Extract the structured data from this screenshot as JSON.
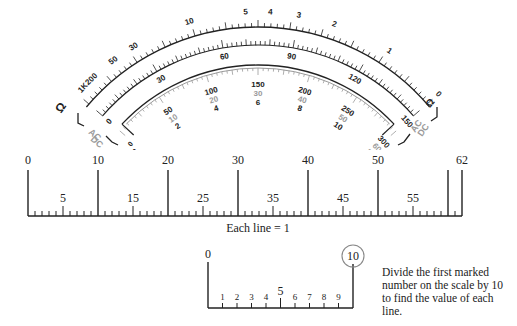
{
  "meter": {
    "ohms_scale": {
      "symbol": "Ω",
      "labels": [
        "1K",
        "200",
        "50",
        "30",
        "10",
        "5",
        "4",
        "3",
        "2",
        "1",
        "0"
      ]
    },
    "dc_voltage_scale": {
      "labels": [
        "0",
        "30",
        "60",
        "90",
        "120",
        "150"
      ]
    },
    "ac_scale": {
      "row1": [
        "0",
        "50",
        "100",
        "150",
        "200",
        "250",
        "300"
      ],
      "row2": [
        "0",
        "10",
        "20",
        "30",
        "40",
        "50",
        "60"
      ],
      "row3": [
        "0",
        "2",
        "4",
        "6",
        "8",
        "10",
        "12"
      ]
    },
    "left_bracket_labels": [
      "Ω",
      "AC",
      "DC"
    ],
    "right_bracket_labels": [
      "Ω",
      "AC",
      "DC"
    ],
    "colors": {
      "ink": "#222222",
      "gray_ink": "#9a9a9a"
    }
  },
  "ruler": {
    "major_labels": [
      "0",
      "10",
      "20",
      "30",
      "40",
      "50",
      "62"
    ],
    "minor_labels": [
      "5",
      "15",
      "25",
      "35",
      "45",
      "55"
    ],
    "min": 0,
    "max": 62,
    "caption": "Each line = 1"
  },
  "mini_scale": {
    "start_label": "0",
    "end_label": "10",
    "tick_labels": [
      "1",
      "2",
      "3",
      "4",
      "5",
      "6",
      "7",
      "8",
      "9"
    ],
    "note": "Divide the first marked number on the scale by 10 to find the value of each line."
  }
}
